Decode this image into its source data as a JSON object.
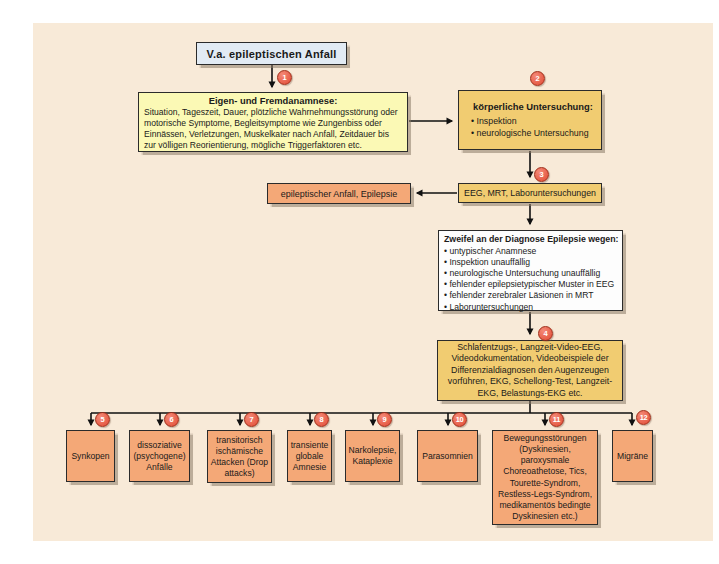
{
  "colors": {
    "panel_bg": "#f8ead8",
    "light_yellow_box": "#fbf9b5",
    "gold_box": "#f1cc71",
    "orange_box": "#f4a877",
    "start_box_blue": "#e2ebf4",
    "white_box": "#fdfdfd",
    "number_circle_red": "#e14a33",
    "number_circle_border": "#9e2c18",
    "line_color": "#111111"
  },
  "start": {
    "label": "V.a. epileptischen Anfall"
  },
  "step1": {
    "num": "1",
    "title": "Eigen- und Fremdanamnese:",
    "body": "Situation, Tageszeit, Dauer, plötzliche Wahrnehmungsstörung oder motorische Symptome, Begleitsymptome wie Zungenbiss oder Einnässen, Verletzungen, Muskelkater nach Anfall, Zeitdauer bis zur völligen Reorientierung, mögliche Triggerfaktoren etc."
  },
  "step2": {
    "num": "2",
    "title": "körperliche Untersuchung:",
    "bullets": [
      "Inspektion",
      "neurologische Untersuchung"
    ]
  },
  "step3": {
    "num": "3",
    "label": "EEG, MRT, Laboruntersuchungen"
  },
  "result": {
    "label": "epileptischer Anfall, Epilepsie"
  },
  "doubt": {
    "title": "Zweifel an der Diagnose Epilepsie wegen:",
    "bullets": [
      "untypischer Anamnese",
      "Inspektion unauffällig",
      "neurologische Untersuchung unauffällig",
      "fehlender epilepsietypischer Muster in EEG",
      "fehlender zerebraler Läsionen in MRT",
      "Laboruntersuchungen"
    ]
  },
  "step4": {
    "num": "4",
    "body": "Schlafentzugs-, Langzeit-Video-EEG, Videodokumentation, Videobeispiele der Differenzialdiagnosen den Augenzeugen vorführen, EKG, Schellong-Test, Langzeit-EKG, Belastungs-EKG etc."
  },
  "differentials": [
    {
      "num": "5",
      "label": "Synkopen"
    },
    {
      "num": "6",
      "label": "dissoziative (psychogene) Anfälle"
    },
    {
      "num": "7",
      "label": "transitorisch ischämische Attacken (Drop attacks)"
    },
    {
      "num": "8",
      "label": "transiente globale Amnesie"
    },
    {
      "num": "9",
      "label": "Narkolepsie, Kataplexie"
    },
    {
      "num": "10",
      "label": "Parasomnien"
    },
    {
      "num": "11",
      "label": "Bewegungsstörungen (Dyskinesien, paroxysmale Choreoathetose, Tics, Tourette-Syndrom, Restless-Legs-Syndrom, medikamentös bedingte Dyskinesien etc.)"
    },
    {
      "num": "12",
      "label": "Migräne"
    }
  ]
}
